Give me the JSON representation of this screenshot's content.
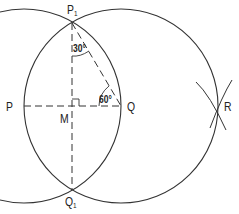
{
  "diagram": {
    "type": "geometric-construction",
    "points": {
      "P": {
        "label": "P",
        "x": 24,
        "y": 106
      },
      "P1": {
        "label": "P",
        "sub": "1",
        "x": 72,
        "y": 23
      },
      "Q": {
        "label": "Q",
        "x": 121,
        "y": 106
      },
      "Q1": {
        "label": "Q",
        "sub": "1",
        "x": 72,
        "y": 190
      },
      "M": {
        "label": "M",
        "x": 72,
        "y": 106
      },
      "R": {
        "label": "R",
        "x": 218,
        "y": 106
      }
    },
    "angles": {
      "at_P1": "30°",
      "at_Q": "60°"
    },
    "colors": {
      "stroke": "#333333",
      "background": "#ffffff"
    }
  }
}
